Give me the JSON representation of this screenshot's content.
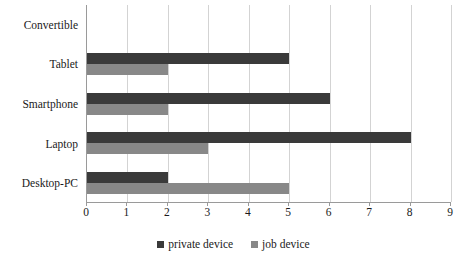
{
  "chart_data": {
    "type": "bar",
    "orientation": "horizontal",
    "title": "",
    "xlabel": "",
    "ylabel": "",
    "categories": [
      "Convertible",
      "Tablet",
      "Smartphone",
      "Laptop",
      "Desktop-PC"
    ],
    "series": [
      {
        "name": "private device",
        "color": "#3a3a3a",
        "values": [
          0,
          5,
          6,
          8,
          2
        ]
      },
      {
        "name": "job device",
        "color": "#888888",
        "values": [
          0,
          2,
          2,
          3,
          5
        ]
      }
    ],
    "xlim": [
      0,
      9
    ],
    "xticks": [
      "0",
      "1",
      "2",
      "3",
      "4",
      "5",
      "6",
      "7",
      "8",
      "9"
    ],
    "grid": "vertical",
    "legend_position": "bottom"
  },
  "legend": {
    "entries": [
      {
        "label": "private device",
        "marker": "square-marker"
      },
      {
        "label": "job device",
        "marker": "square-marker"
      }
    ]
  },
  "colors": {
    "private_device": "#3a3a3a",
    "job_device": "#888888",
    "gridline": "#d3d3d3",
    "axis": "#9a9a9a",
    "text": "#1a1a1a",
    "background": "#ffffff"
  }
}
